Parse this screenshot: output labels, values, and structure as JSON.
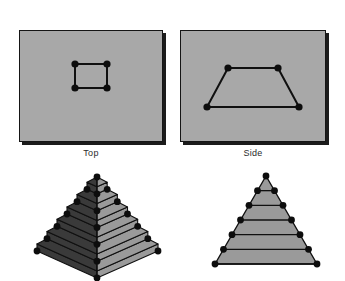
{
  "figure": {
    "background_color": "#ffffff",
    "width": 345,
    "height": 281
  },
  "palette": {
    "panel_fill": "#a8a8a8",
    "panel_border": "#151515",
    "panel_shadow": "#1b1b1b",
    "point_color": "#0d0d0d",
    "wire_color": "#101010",
    "solid_light_face": "#9a9a9a",
    "solid_dark_face": "#3a3a3a",
    "solid_outline": "#101010",
    "label_color": "#2b2b2b"
  },
  "panels": [
    {
      "id": "top-view",
      "label": "Top",
      "x": 19,
      "y": 30,
      "width": 144,
      "height": 112,
      "shape": "square",
      "points": [
        {
          "x": 56,
          "y": 34
        },
        {
          "x": 88,
          "y": 34
        },
        {
          "x": 56,
          "y": 58
        },
        {
          "x": 88,
          "y": 58
        }
      ],
      "edges": [
        [
          0,
          1
        ],
        [
          1,
          3
        ],
        [
          3,
          2
        ],
        [
          2,
          0
        ]
      ]
    },
    {
      "id": "side-view",
      "label": "Side",
      "x": 180,
      "y": 30,
      "width": 146,
      "height": 112,
      "shape": "trapezoid",
      "points": [
        {
          "x": 48,
          "y": 38
        },
        {
          "x": 98,
          "y": 38
        },
        {
          "x": 27,
          "y": 77
        },
        {
          "x": 119,
          "y": 77
        }
      ],
      "edges": [
        [
          0,
          1
        ],
        [
          1,
          3
        ],
        [
          3,
          2
        ],
        [
          2,
          0
        ]
      ]
    }
  ],
  "labels": {
    "top": "Top",
    "side": "Side",
    "top_label_x": 19,
    "top_label_y": 148,
    "side_label_x": 180,
    "side_label_y": 148
  },
  "solids": [
    {
      "id": "pyramid-3d",
      "kind": "stepped-pyramid-3d",
      "x": 25,
      "y": 166,
      "width": 145,
      "height": 115,
      "levels": 6,
      "apex": {
        "x": 72,
        "y": 11
      },
      "base_left": {
        "x": 12,
        "y": 85
      },
      "base_right": {
        "x": 133,
        "y": 85
      },
      "base_front": {
        "x": 72,
        "y": 112
      },
      "point_count": 26
    },
    {
      "id": "pyramid-2d",
      "kind": "stepped-pyramid-2d",
      "x": 200,
      "y": 166,
      "width": 130,
      "height": 105,
      "levels": 6,
      "apex": {
        "x": 66,
        "y": 10
      },
      "base_left": {
        "x": 15,
        "y": 98
      },
      "base_right": {
        "x": 117,
        "y": 98
      },
      "point_count": 13
    }
  ]
}
